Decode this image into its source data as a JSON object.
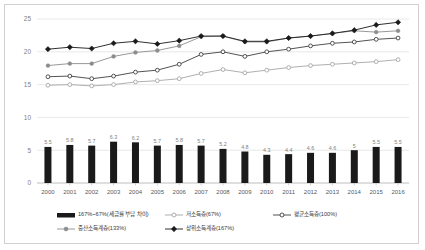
{
  "chart_data": {
    "type": "line",
    "title": "",
    "subtitle": "",
    "xlabel": "",
    "ylabel": "",
    "ylim": [
      0,
      25
    ],
    "yticks": [
      0,
      5,
      10,
      15,
      20,
      25
    ],
    "grid": true,
    "legend_position": "bottom",
    "categories": [
      "2000",
      "2001",
      "2002",
      "2003",
      "2004",
      "2005",
      "2006",
      "2007",
      "2008",
      "2009",
      "2010",
      "2011",
      "2012",
      "2013",
      "2014",
      "2015",
      "2016"
    ],
    "series": [
      {
        "name": "167%~67%(세금률 부담 차이)",
        "type": "bar",
        "marker": "bar",
        "color": "#1a1a1a",
        "values": [
          5.5,
          5.8,
          5.7,
          6.3,
          6.2,
          5.7,
          5.8,
          5.7,
          5.2,
          4.8,
          4.3,
          4.4,
          4.6,
          4.6,
          5,
          5.5,
          5.5
        ],
        "data_labels": [
          "5.5",
          "5.8",
          "5.7",
          "6.3",
          "6.2",
          "5.7",
          "5.8",
          "5.7",
          "5.2",
          "4.8",
          "4.3",
          "4.4",
          "4.6",
          "4.6",
          "5",
          "5.5",
          "5.5"
        ]
      },
      {
        "name": "저소득층(67%)",
        "type": "line",
        "marker": "open-circle",
        "color": "#a6a6a6",
        "values": [
          14.9,
          15.0,
          14.8,
          15.0,
          15.4,
          15.6,
          15.9,
          16.7,
          17.3,
          16.8,
          17.2,
          17.6,
          17.9,
          18.1,
          18.3,
          18.5,
          18.8
        ]
      },
      {
        "name": "평균소득층(100%)",
        "type": "line",
        "marker": "open-circle",
        "color": "#404040",
        "values": [
          16.2,
          16.3,
          15.9,
          16.3,
          16.9,
          17.2,
          18.1,
          19.6,
          20.0,
          19.3,
          20.0,
          20.4,
          20.9,
          21.3,
          21.5,
          21.9,
          22.1
        ]
      },
      {
        "name": "중산소득계층(133%)",
        "type": "line",
        "marker": "filled-circle",
        "color": "#8c8c8c",
        "values": [
          17.9,
          18.2,
          18.2,
          19.3,
          19.9,
          20.2,
          20.9,
          22.3,
          22.4,
          21.5,
          21.5,
          22.1,
          22.4,
          22.8,
          23.2,
          23.0,
          23.2
        ]
      },
      {
        "name": "상위소득계층(167%)",
        "type": "line",
        "marker": "filled-diamond",
        "color": "#1a1a1a",
        "values": [
          20.4,
          20.7,
          20.5,
          21.3,
          21.6,
          21.2,
          21.7,
          22.4,
          22.4,
          21.6,
          21.6,
          22.1,
          22.4,
          22.8,
          23.3,
          24.1,
          24.5
        ]
      }
    ]
  }
}
